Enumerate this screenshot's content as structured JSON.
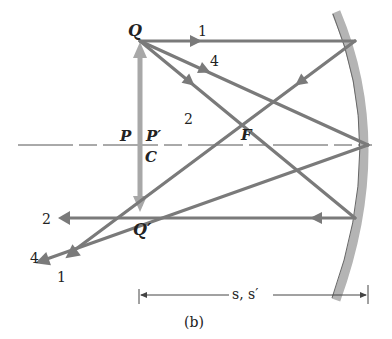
{
  "figure": {
    "caption": "(b)",
    "dimension_label": "s, s′"
  },
  "points": {
    "Q": "Q",
    "Q_prime": "Q′",
    "P": "P",
    "P_prime": "P′",
    "C": "C",
    "F": "F"
  },
  "rays": {
    "incident": [
      {
        "id": "1",
        "label": "1"
      },
      {
        "id": "4",
        "label": "4"
      },
      {
        "id": "2",
        "label": "2"
      }
    ],
    "reflected": [
      {
        "id": "2",
        "label": "2"
      },
      {
        "id": "4",
        "label": "4"
      },
      {
        "id": "1",
        "label": "1"
      }
    ]
  },
  "colors": {
    "ray": "#7a7a7a",
    "object_arrow": "#a8a8a8",
    "mirror": "#b4b4b4",
    "axis": "#555555",
    "text": "#222222"
  }
}
